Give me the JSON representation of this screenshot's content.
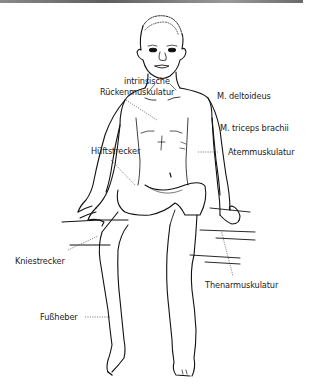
{
  "figure": {
    "labels": {
      "intrinsic_back_line1": "intrinsische",
      "intrinsic_back_line2": "Rückenmuskulatur",
      "deltoid": "M. deltoideus",
      "triceps": "M. triceps brachii",
      "respiratory": "Atemmuskulatur",
      "hip_extensor": "Hüftstrecker",
      "knee_extensor": "Kniestrecker",
      "thenar": "Thenarmuskulatur",
      "foot_lifter": "Fußheber"
    },
    "colors": {
      "line": "#111111",
      "text": "#222222",
      "leader": "#555555",
      "top_bar": "#707070"
    }
  }
}
